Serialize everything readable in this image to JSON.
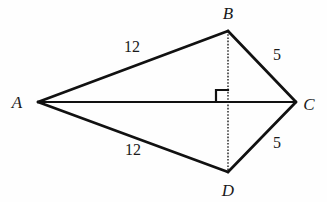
{
  "figure": {
    "kind": "geometry-diagram",
    "background_color": "#fefefe",
    "stroke_color": "#111111",
    "text_color": "#1a1a1a"
  },
  "vertices": [
    {
      "id": "A",
      "label": "A",
      "point_x": 38,
      "point_y": 102,
      "label_x": 17,
      "label_y": 102
    },
    {
      "id": "B",
      "label": "B",
      "point_x": 228,
      "point_y": 31,
      "label_x": 228,
      "label_y": 13
    },
    {
      "id": "C",
      "label": "C",
      "point_x": 296,
      "point_y": 102,
      "label_x": 309,
      "label_y": 104
    },
    {
      "id": "D",
      "label": "D",
      "point_x": 228,
      "point_y": 172,
      "label_x": 228,
      "label_y": 190
    }
  ],
  "edges": [
    {
      "id": "AB",
      "from": "A",
      "to": "B",
      "style": "solid",
      "width": 2.6
    },
    {
      "id": "BC",
      "from": "B",
      "to": "C",
      "style": "solid",
      "width": 2.6
    },
    {
      "id": "AD",
      "from": "A",
      "to": "D",
      "style": "solid",
      "width": 2.6
    },
    {
      "id": "DC",
      "from": "D",
      "to": "C",
      "style": "solid",
      "width": 2.6
    },
    {
      "id": "AC",
      "from": "A",
      "to": "C",
      "style": "solid",
      "width": 2.0
    },
    {
      "id": "BD",
      "from": "B",
      "to": "D",
      "style": "dotted",
      "width": 1.4
    }
  ],
  "side_labels": [
    {
      "id": "AB-length",
      "edge": "AB",
      "text": "12",
      "x": 132,
      "y": 47
    },
    {
      "id": "BC-length",
      "edge": "BC",
      "text": "5",
      "x": 277,
      "y": 55
    },
    {
      "id": "AD-length",
      "edge": "AD",
      "text": "12",
      "x": 133,
      "y": 150
    },
    {
      "id": "DC-length",
      "edge": "DC",
      "text": "5",
      "x": 277,
      "y": 143
    }
  ],
  "right_angle": {
    "id": "right-angle-marker",
    "vertex_x": 228,
    "vertex_y": 102,
    "size": 12,
    "orientation": "upper-left"
  }
}
